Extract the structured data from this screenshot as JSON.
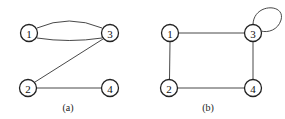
{
  "graphs": [
    {
      "caption": "(a)",
      "nodes": [
        {
          "id": "1",
          "label": "1",
          "x": 29,
          "y": 33
        },
        {
          "id": "3",
          "label": "3",
          "x": 110,
          "y": 33
        },
        {
          "id": "2",
          "label": "2",
          "x": 28,
          "y": 88
        },
        {
          "id": "4",
          "label": "4",
          "x": 110,
          "y": 88
        }
      ],
      "edges": [
        {
          "from": "1",
          "to": "3",
          "type": "curve-up"
        },
        {
          "from": "1",
          "to": "3",
          "type": "curve-down"
        },
        {
          "from": "2",
          "to": "3",
          "type": "straight"
        },
        {
          "from": "2",
          "to": "4",
          "type": "straight"
        }
      ]
    },
    {
      "caption": "(b)",
      "nodes": [
        {
          "id": "1",
          "label": "1",
          "x": 170,
          "y": 33
        },
        {
          "id": "3",
          "label": "3",
          "x": 253,
          "y": 33
        },
        {
          "id": "2",
          "label": "2",
          "x": 169,
          "y": 88
        },
        {
          "id": "4",
          "label": "4",
          "x": 253,
          "y": 88
        }
      ],
      "edges": [
        {
          "from": "1",
          "to": "3",
          "type": "straight"
        },
        {
          "from": "1",
          "to": "2",
          "type": "straight"
        },
        {
          "from": "2",
          "to": "4",
          "type": "straight"
        },
        {
          "from": "3",
          "to": "4",
          "type": "straight"
        },
        {
          "from": "3",
          "to": "3",
          "type": "self-loop"
        }
      ]
    }
  ]
}
